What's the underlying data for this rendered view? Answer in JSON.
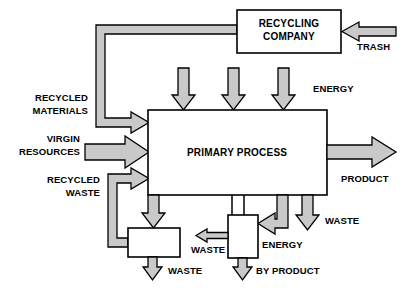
{
  "diagram": {
    "colors": {
      "arrow_fill": "#c9c9c9",
      "box_fill": "#ffffff",
      "stroke": "#000000",
      "background": "#ffffff"
    },
    "boxes": [
      {
        "id": "recycling-company",
        "label_line1": "RECYCLING",
        "label_line2": "COMPANY"
      },
      {
        "id": "primary-process",
        "label_line1": "PRIMARY PROCESS",
        "label_line2": ""
      },
      {
        "id": "waste-treatment",
        "label_line1": "",
        "label_line2": ""
      },
      {
        "id": "energy-recovery",
        "label_line1": "",
        "label_line2": ""
      }
    ],
    "labels": {
      "recycling_company_line1": "RECYCLING",
      "recycling_company_line2": "COMPANY",
      "primary_process": "PRIMARY PROCESS",
      "trash": "TRASH",
      "energy_top": "ENERGY",
      "recycled_materials_line1": "RECYCLED",
      "recycled_materials_line2": "MATERIALS",
      "virgin_resources_line1": "VIRGIN",
      "virgin_resources_line2": "RESOURCES",
      "recycled_waste_line1": "RECYCLED",
      "recycled_waste_line2": "WASTE",
      "product": "PRODUCT",
      "waste_right": "WASTE",
      "waste_middle": "WASTE",
      "waste_bottom_left": "WASTE",
      "energy_bottom": "ENERGY",
      "by_product": "BY PRODUCT"
    },
    "flows": [
      {
        "name": "trash-input",
        "from": "external",
        "to": "recycling-company",
        "direction": "left",
        "label": "TRASH"
      },
      {
        "name": "recycled-materials-loop",
        "from": "recycling-company",
        "to": "primary-process",
        "direction": "down-right",
        "label": "RECYCLED MATERIALS"
      },
      {
        "name": "virgin-resources-input",
        "from": "external",
        "to": "primary-process",
        "direction": "right",
        "label": "VIRGIN RESOURCES"
      },
      {
        "name": "recycled-waste-loop",
        "from": "waste-treatment",
        "to": "primary-process",
        "direction": "up-right",
        "label": "RECYCLED WASTE"
      },
      {
        "name": "energy-input-1",
        "from": "external",
        "to": "primary-process",
        "direction": "down",
        "label": "ENERGY"
      },
      {
        "name": "energy-input-2",
        "from": "external",
        "to": "primary-process",
        "direction": "down",
        "label": "ENERGY"
      },
      {
        "name": "energy-input-3",
        "from": "external",
        "to": "primary-process",
        "direction": "down",
        "label": "ENERGY"
      },
      {
        "name": "product-output",
        "from": "primary-process",
        "to": "external",
        "direction": "right",
        "label": "PRODUCT"
      },
      {
        "name": "waste-output-right",
        "from": "primary-process",
        "to": "external",
        "direction": "down",
        "label": "WASTE"
      },
      {
        "name": "waste-to-treatment",
        "from": "primary-process",
        "to": "waste-treatment",
        "direction": "down",
        "label": ""
      },
      {
        "name": "energy-to-recovery",
        "from": "primary-process",
        "to": "energy-recovery",
        "direction": "down-left",
        "label": "ENERGY"
      },
      {
        "name": "waste-from-recovery",
        "from": "energy-recovery",
        "to": "external",
        "direction": "left",
        "label": "WASTE"
      },
      {
        "name": "waste-from-treatment",
        "from": "waste-treatment",
        "to": "external",
        "direction": "down",
        "label": "WASTE"
      },
      {
        "name": "by-product-output",
        "from": "energy-recovery",
        "to": "external",
        "direction": "down",
        "label": "BY PRODUCT"
      }
    ]
  }
}
